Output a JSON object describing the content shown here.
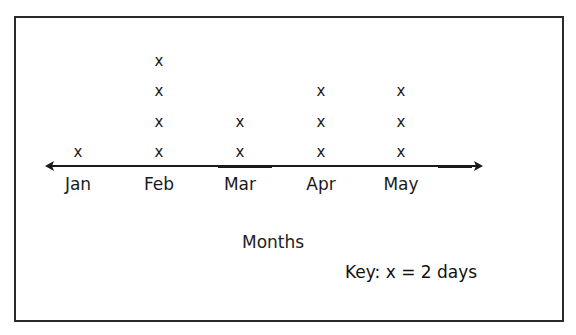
{
  "chart_data": {
    "type": "line_plot",
    "title": "",
    "categories": [
      "Jan",
      "Feb",
      "Mar",
      "Apr",
      "May"
    ],
    "values": [
      1,
      4,
      2,
      3,
      3
    ],
    "xlabel": "Months",
    "ylabel": "",
    "marker": "x",
    "key": "Key:  x = 2 days",
    "key_value_per_mark": 2,
    "days": [
      2,
      8,
      4,
      6,
      6
    ],
    "grid": false,
    "axis": "number line with arrows on both ends"
  },
  "labels": {
    "xlabel": "Months",
    "key": "Key:  x = 2 days"
  }
}
